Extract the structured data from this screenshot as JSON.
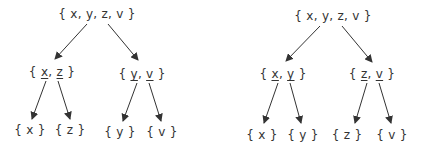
{
  "diagram": {
    "type": "set-partition-trees",
    "colors": {
      "text": "#333333",
      "edge": "#333333",
      "background": "#ffffff"
    },
    "trees": [
      {
        "id": "left",
        "root": {
          "label": "{ x, y, z, v }",
          "x": 97,
          "y": 14
        },
        "children": [
          {
            "open": "{ ",
            "a": "x",
            "sep": ", ",
            "b": "z",
            "close": " }",
            "underlined": [
              "x",
              "z"
            ],
            "x": 52,
            "y": 72,
            "leaves": [
              {
                "label": "{ x }",
                "x": 30,
                "y": 130
              },
              {
                "label": "{ z }",
                "x": 70,
                "y": 130
              }
            ]
          },
          {
            "open": "{ ",
            "a": "y",
            "sep": ", ",
            "b": "v",
            "close": " }",
            "underlined": [
              "y",
              "v"
            ],
            "x": 142,
            "y": 74,
            "leaves": [
              {
                "label": "{ y }",
                "x": 120,
                "y": 132
              },
              {
                "label": "{ v }",
                "x": 162,
                "y": 132
              }
            ]
          }
        ]
      },
      {
        "id": "right",
        "root": {
          "label": "{ x, y, z, v }",
          "x": 333,
          "y": 16
        },
        "children": [
          {
            "open": "{ ",
            "a": "x",
            "sep": ", ",
            "b": "y",
            "close": " }",
            "underlined": [
              "x",
              "y"
            ],
            "x": 283,
            "y": 74,
            "leaves": [
              {
                "label": "{ x }",
                "x": 262,
                "y": 135
              },
              {
                "label": "{ y }",
                "x": 303,
                "y": 135
              }
            ]
          },
          {
            "open": "{ ",
            "a": "z",
            "sep": ", ",
            "b": "v",
            "close": " }",
            "underlined": [
              "z",
              "v"
            ],
            "x": 372,
            "y": 74,
            "leaves": [
              {
                "label": "{ z }",
                "x": 347,
                "y": 135
              },
              {
                "label": "{ v }",
                "x": 392,
                "y": 135
              }
            ]
          }
        ]
      }
    ]
  }
}
